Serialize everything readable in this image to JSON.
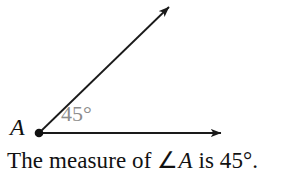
{
  "canvas": {
    "width": 307,
    "height": 179,
    "background": "#ffffff"
  },
  "figure": {
    "type": "geometry-angle-diagram",
    "stroke_color": "#1a1a1a",
    "vertex_label": "A",
    "vertex_point": {
      "x": 39,
      "y": 133
    },
    "angle_label": "45°",
    "angle_label_color": "#8d8d8d",
    "rays": [
      {
        "name": "horizontal-ray",
        "from": {
          "x": 39,
          "y": 133
        },
        "to": {
          "x": 223,
          "y": 133
        },
        "arrowhead": "solid-triangle"
      },
      {
        "name": "diagonal-ray",
        "from": {
          "x": 39,
          "y": 133
        },
        "to": {
          "x": 171,
          "y": 5
        },
        "arrowhead": "solid-triangle"
      }
    ],
    "measure_degrees": 45
  },
  "caption": {
    "prefix": "The measure of ∠",
    "variable": "A",
    "suffix": " is 45°."
  }
}
